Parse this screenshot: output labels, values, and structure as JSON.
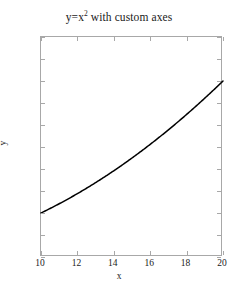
{
  "chart_data": {
    "type": "line",
    "title_base": "y=x",
    "title_sup": "2",
    "title_rest": " with custom axes",
    "xlabel": "x",
    "ylabel": "y",
    "xlim": [
      10,
      20
    ],
    "ylim": [
      0,
      500
    ],
    "grid": false,
    "legend": null,
    "line_color": "#000000",
    "line_width": 1.5,
    "axis_color": "#a8a8a8",
    "background": "#ffffff",
    "text_color": "#1a1a1a",
    "xticks": [
      10,
      12,
      14,
      16,
      18,
      20
    ],
    "xtick_labels": [
      "10",
      "12",
      "14",
      "16",
      "18",
      "20"
    ],
    "yticks": [
      0,
      50,
      100,
      150,
      200,
      250,
      300,
      350,
      400,
      450,
      500
    ],
    "ytick_labels": [
      "0",
      "50",
      "100",
      "150",
      "200",
      "250",
      "300",
      "350",
      "400",
      "450",
      "500"
    ],
    "series": [
      {
        "name": "y=x^2",
        "x": [
          10,
          10.5,
          11,
          11.5,
          12,
          12.5,
          13,
          13.5,
          14,
          14.5,
          15,
          15.5,
          16,
          16.5,
          17,
          17.5,
          18,
          18.5,
          19,
          19.5,
          20
        ],
        "values": [
          100,
          110.25,
          121,
          132.25,
          144,
          156.25,
          169,
          182.25,
          196,
          210.25,
          225,
          240.25,
          256,
          272.25,
          289,
          306.25,
          324,
          342.25,
          361,
          380.25,
          400
        ]
      }
    ]
  }
}
